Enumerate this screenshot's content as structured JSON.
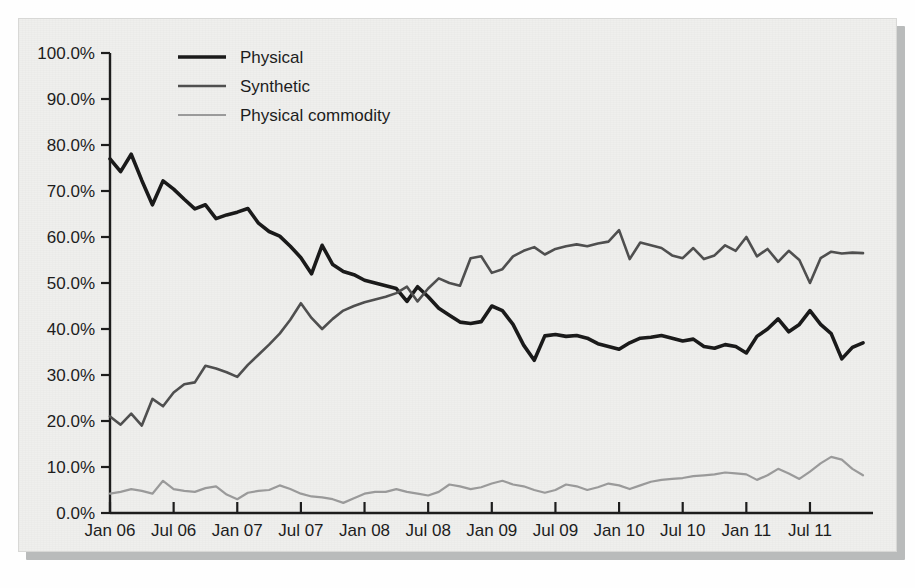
{
  "figure": {
    "background_color": "#efefed",
    "frame_color": "#d8d8d6",
    "shadow_color": "#b9bbbb"
  },
  "legend": {
    "position": "top-left-inside",
    "entries": [
      {
        "label": "Physical",
        "color": "#1a1a1a",
        "width": 3.6
      },
      {
        "label": "Synthetic",
        "color": "#4f4f4f",
        "width": 2.6
      },
      {
        "label": "Physical commodity",
        "color": "#9a9a9a",
        "width": 2.2
      }
    ]
  },
  "chart_data": {
    "type": "line",
    "title": "",
    "xlabel": "",
    "ylabel": "",
    "ylim": [
      0,
      100
    ],
    "yticks": [
      0,
      10,
      20,
      30,
      40,
      50,
      60,
      70,
      80,
      90,
      100
    ],
    "ytick_labels": [
      "0.0%",
      "10.0%",
      "20.0%",
      "30.0%",
      "40.0%",
      "50.0%",
      "60.0%",
      "70.0%",
      "80.0%",
      "90.0%",
      "100.0%"
    ],
    "grid": false,
    "x_tick_labels": [
      "Jan 06",
      "Jul 06",
      "Jan 07",
      "Jul 07",
      "Jan 08",
      "Jul 08",
      "Jan 09",
      "Jul 09",
      "Jan 10",
      "Jul 10",
      "Jan 11",
      "Jul 11"
    ],
    "x_tick_indices": [
      0,
      6,
      12,
      18,
      24,
      30,
      36,
      42,
      48,
      54,
      60,
      66
    ],
    "x_count": 72,
    "x_start": "Jan 06",
    "x_end": "Dec 11",
    "series": [
      {
        "name": "Physical",
        "color": "#1a1a1a",
        "width": 3.6,
        "values": [
          77.0,
          74.2,
          78.0,
          72.3,
          67.0,
          72.2,
          70.4,
          68.2,
          66.1,
          67.0,
          64.0,
          64.8,
          65.4,
          66.2,
          63.0,
          61.2,
          60.2,
          58.0,
          55.5,
          52.0,
          58.2,
          54.0,
          52.5,
          51.8,
          50.6,
          50.0,
          49.4,
          48.8,
          46.0,
          49.2,
          47.0,
          44.5,
          43.0,
          41.5,
          41.2,
          41.6,
          45.0,
          44.0,
          41.0,
          36.5,
          33.2,
          38.5,
          38.8,
          38.4,
          38.6,
          38.0,
          36.8,
          36.2,
          35.6,
          37.0,
          38.0,
          38.2,
          38.6,
          38.0,
          37.4,
          37.8,
          36.2,
          35.8,
          36.6,
          36.2,
          34.8,
          38.4,
          40.0,
          42.2,
          39.4,
          41.0,
          44.0,
          41.0,
          39.0,
          33.5,
          36.0,
          37.0
        ]
      },
      {
        "name": "Synthetic",
        "color": "#4f4f4f",
        "width": 2.6,
        "values": [
          21.0,
          19.2,
          21.6,
          19.0,
          24.8,
          23.2,
          26.2,
          28.0,
          28.4,
          32.0,
          31.4,
          30.6,
          29.6,
          32.2,
          34.4,
          36.6,
          39.0,
          42.0,
          45.6,
          42.4,
          40.0,
          42.2,
          44.0,
          45.0,
          45.8,
          46.4,
          47.0,
          47.8,
          49.2,
          46.0,
          48.8,
          51.0,
          50.0,
          49.4,
          55.4,
          55.8,
          52.2,
          53.0,
          55.8,
          57.0,
          57.8,
          56.2,
          57.4,
          58.0,
          58.4,
          58.0,
          58.6,
          59.0,
          61.5,
          55.2,
          58.8,
          58.2,
          57.6,
          56.0,
          55.4,
          57.6,
          55.2,
          56.0,
          58.2,
          57.0,
          60.0,
          55.8,
          57.4,
          54.6,
          57.0,
          55.0,
          50.0,
          55.4,
          56.8,
          56.4,
          56.6,
          56.5
        ]
      },
      {
        "name": "Physical commodity",
        "color": "#9a9a9a",
        "width": 2.2,
        "values": [
          4.2,
          4.6,
          5.2,
          4.8,
          4.2,
          7.0,
          5.2,
          4.8,
          4.6,
          5.4,
          5.8,
          4.0,
          3.0,
          4.4,
          4.8,
          5.0,
          6.0,
          5.2,
          4.2,
          3.6,
          3.4,
          3.0,
          2.2,
          3.2,
          4.2,
          4.6,
          4.6,
          5.2,
          4.6,
          4.2,
          3.8,
          4.6,
          6.2,
          5.8,
          5.2,
          5.6,
          6.4,
          7.0,
          6.2,
          5.8,
          5.0,
          4.4,
          5.0,
          6.2,
          5.8,
          5.0,
          5.6,
          6.4,
          6.0,
          5.2,
          6.0,
          6.8,
          7.2,
          7.4,
          7.6,
          8.0,
          8.2,
          8.4,
          8.8,
          8.6,
          8.4,
          7.2,
          8.2,
          9.6,
          8.6,
          7.4,
          9.0,
          10.8,
          12.2,
          11.6,
          9.6,
          8.2
        ]
      }
    ]
  }
}
